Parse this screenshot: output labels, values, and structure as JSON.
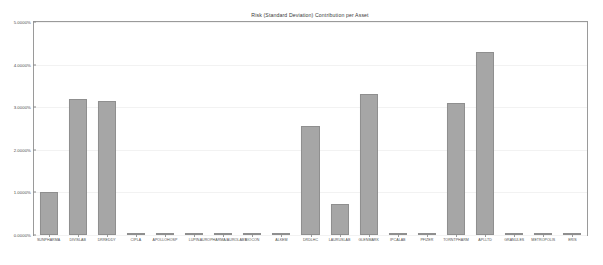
{
  "chart_data": {
    "type": "bar",
    "title": "Risk (Standard Deviation) Contribution per Asset",
    "xlabel": "",
    "ylabel": "",
    "ylim": [
      0,
      5
    ],
    "ytick_labels": [
      "5.0000%",
      "4.0000%",
      "3.0000%",
      "2.0000%",
      "1.0000%",
      "0.0000%"
    ],
    "ytick_values": [
      5,
      4,
      3,
      2,
      1,
      0
    ],
    "grid": true,
    "legend": "none",
    "units": "percent",
    "bar_color": "#a6a6a6",
    "bar_edge_color": "#8f8f8f",
    "categories": [
      "SUNPHARMA",
      "DIVISLAB",
      "DRREDDY",
      "CIPLA",
      "APOLLOHOSP",
      "LUPIN",
      "AUROPHARMA/AUROLABS",
      "BIOCON",
      "ALKEM",
      "DRDLHC",
      "LAURUSLAB",
      "GLENMARK",
      "IPCALAB",
      "PFIZER",
      "TORNTPHARM",
      "APLLTD",
      "GRANULES",
      "METROPOLIS",
      "ERIS"
    ],
    "values": [
      1.0,
      3.2,
      3.15,
      0.02,
      0.02,
      0.02,
      0.02,
      0.02,
      0.02,
      2.55,
      0.73,
      3.3,
      0.05,
      0.02,
      3.1,
      4.3,
      0.02,
      0.02,
      0.02
    ]
  }
}
